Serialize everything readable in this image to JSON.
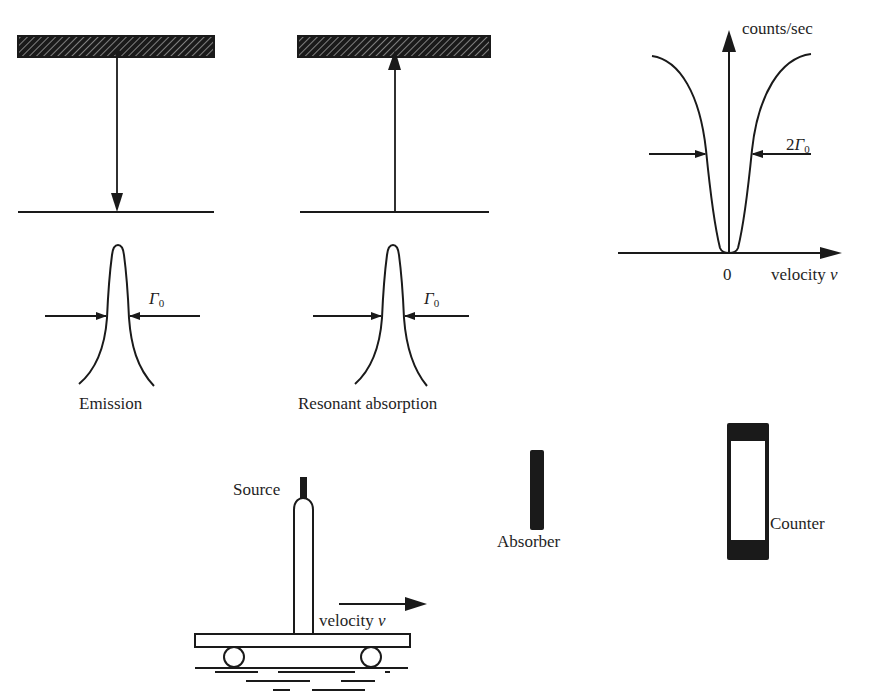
{
  "panels": {
    "emission": {
      "caption": "Emission",
      "linewidth_symbol": "Γ",
      "linewidth_subscript": "0"
    },
    "absorption": {
      "caption": "Resonant absorption",
      "linewidth_symbol": "Γ",
      "linewidth_subscript": "0"
    },
    "spectrum": {
      "y_axis_label": "counts/sec",
      "x_axis_label": "velocity",
      "x_axis_var": "v",
      "origin_label": "0",
      "width_prefix": "2",
      "width_symbol": "Γ",
      "width_subscript": "0"
    },
    "apparatus": {
      "source_label": "Source",
      "velocity_label": "velocity",
      "velocity_var": "v",
      "absorber_label": "Absorber",
      "counter_label": "Counter"
    }
  },
  "colors": {
    "ink": "#1a1a1a",
    "paper": "#ffffff",
    "hatch": "#8a8a8a"
  }
}
